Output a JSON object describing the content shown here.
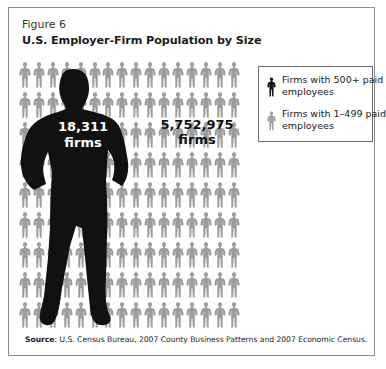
{
  "figure": {
    "label": "Figure 6",
    "title": "U.S. Employer-Firm Population by Size"
  },
  "colors": {
    "large_firm": "#111111",
    "small_firm": "#9d9d9d",
    "frame": "#8c8c8c"
  },
  "annotations": {
    "large_value": "18,311",
    "large_unit": "firms",
    "small_value": "5,752,975",
    "small_unit": "firms"
  },
  "legend": {
    "items": [
      {
        "label_line1": "Firms with 500+ paid",
        "label_line2": "employees",
        "icon": "person-silhouette-black-icon"
      },
      {
        "label_line1": "Firms with 1–499 paid",
        "label_line2": "employees",
        "icon": "person-silhouette-gray-icon"
      }
    ]
  },
  "source": {
    "label": "Source",
    "text": ": U.S. Census Bureau, 2007 County Business Patterns and 2007 Economic Census."
  },
  "grid": {
    "columns": 16,
    "rows": 9
  },
  "chart_data": {
    "type": "pictogram",
    "title": "U.S. Employer-Firm Population by Size",
    "subtitle": "Figure 6",
    "categories": [
      "Firms with 500+ paid employees",
      "Firms with 1–499 paid employees"
    ],
    "values": [
      18311,
      5752975
    ],
    "unit": "firms",
    "legend_position": "right",
    "source": "U.S. Census Bureau, 2007 County Business Patterns and 2007 Economic Census."
  }
}
